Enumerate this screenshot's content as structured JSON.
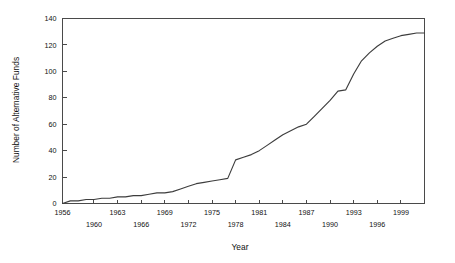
{
  "chart_data": {
    "type": "line",
    "title": "",
    "xlabel": "Year",
    "ylabel": "Number of Alternative Funds",
    "xlim": [
      1956,
      2002
    ],
    "ylim": [
      0,
      140
    ],
    "grid": false,
    "legend": "none",
    "ytick_values": [
      0,
      20,
      40,
      60,
      80,
      100,
      120,
      140
    ],
    "ytick_labels": [
      "0",
      "20",
      "40",
      "60",
      "80",
      "100",
      "120",
      "140"
    ],
    "xtick_values": [
      1956,
      1960,
      1963,
      1966,
      1969,
      1972,
      1975,
      1978,
      1981,
      1984,
      1987,
      1990,
      1993,
      1996,
      1999
    ],
    "xtick_labels_upper": [
      "1956",
      "1963",
      "1969",
      "1975",
      "1981",
      "1987",
      "1993",
      "1999"
    ],
    "xtick_labels_lower": [
      "1960",
      "1966",
      "1972",
      "1978",
      "1984",
      "1990",
      "1996"
    ],
    "series": [
      {
        "name": "Number of Alternative Funds",
        "color": "#3d3d3d",
        "x": [
          1956,
          1957,
          1958,
          1959,
          1960,
          1961,
          1962,
          1963,
          1964,
          1965,
          1966,
          1967,
          1968,
          1969,
          1970,
          1971,
          1972,
          1973,
          1974,
          1975,
          1976,
          1977,
          1978,
          1979,
          1980,
          1981,
          1982,
          1983,
          1984,
          1985,
          1986,
          1987,
          1988,
          1989,
          1990,
          1991,
          1992,
          1993,
          1994,
          1995,
          1996,
          1997,
          1998,
          1999,
          2000,
          2001,
          2002
        ],
        "y": [
          0,
          2,
          2,
          3,
          3,
          4,
          4,
          5,
          5,
          6,
          6,
          7,
          8,
          8,
          9,
          11,
          13,
          15,
          16,
          17,
          18,
          19,
          33,
          35,
          37,
          40,
          44,
          48,
          52,
          55,
          58,
          60,
          66,
          72,
          78,
          85,
          86,
          98,
          108,
          114,
          119,
          123,
          125,
          127,
          128,
          129,
          129
        ]
      }
    ]
  }
}
